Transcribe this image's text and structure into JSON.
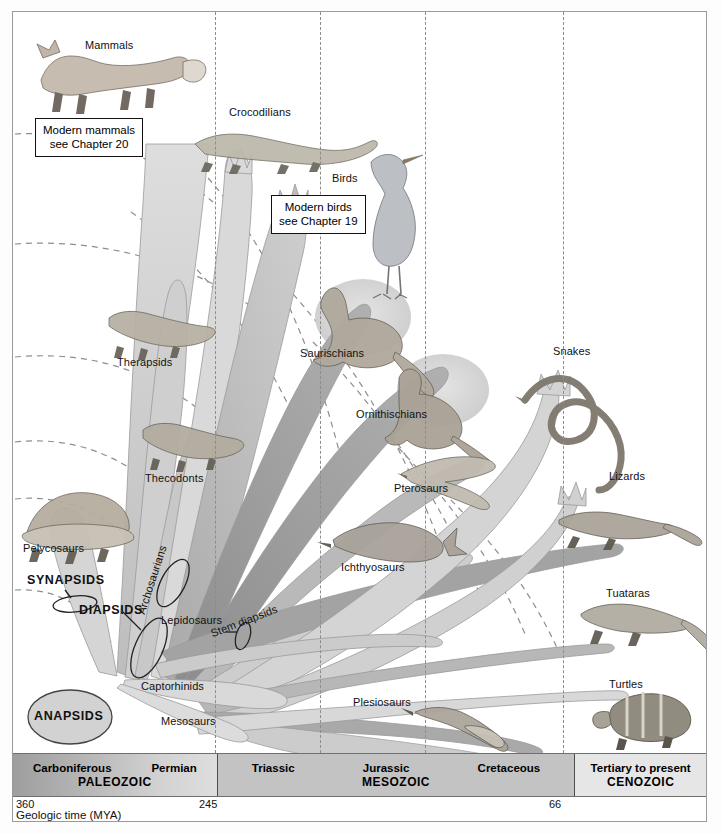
{
  "figure": {
    "caption": "Geologic time (MYA)"
  },
  "callouts": [
    {
      "id": "mammals-callout",
      "line1": "Modern mammals",
      "line2": "see Chapter 20"
    },
    {
      "id": "birds-callout",
      "line1": "Modern birds",
      "line2": "see Chapter 19"
    }
  ],
  "taxa_labels": [
    {
      "name": "Mammals",
      "x": 72,
      "y": 27,
      "style": "plain"
    },
    {
      "name": "Crocodilians",
      "x": 228,
      "y": 94,
      "style": "plain"
    },
    {
      "name": "Birds",
      "x": 331,
      "y": 170,
      "style": "plain"
    },
    {
      "name": "Therapsids",
      "x": 116,
      "y": 354,
      "style": "plain"
    },
    {
      "name": "Saurischians",
      "x": 299,
      "y": 345,
      "style": "plain"
    },
    {
      "name": "Snakes",
      "x": 552,
      "y": 343,
      "style": "plain"
    },
    {
      "name": "Ornithischians",
      "x": 355,
      "y": 406,
      "style": "plain"
    },
    {
      "name": "Thecodonts",
      "x": 144,
      "y": 470,
      "style": "plain"
    },
    {
      "name": "Pterosaurs",
      "x": 393,
      "y": 480,
      "style": "plain"
    },
    {
      "name": "Lizards",
      "x": 608,
      "y": 468,
      "style": "plain"
    },
    {
      "name": "Pelycosaurs",
      "x": 22,
      "y": 540,
      "style": "plain"
    },
    {
      "name": "Ichthyosaurs",
      "x": 340,
      "y": 559,
      "style": "plain"
    },
    {
      "name": "Tuataras",
      "x": 605,
      "y": 585,
      "style": "plain"
    },
    {
      "name": "Plesiosaurs",
      "x": 352,
      "y": 694,
      "style": "plain"
    },
    {
      "name": "Turtles",
      "x": 608,
      "y": 676,
      "style": "plain"
    },
    {
      "name": "Captorhinids",
      "x": 140,
      "y": 678,
      "style": "plain"
    },
    {
      "name": "Mesosaurs",
      "x": 160,
      "y": 713,
      "style": "plain"
    },
    {
      "name": "Lepidosaurs",
      "x": 160,
      "y": 612,
      "style": "plain"
    }
  ],
  "rotated_labels": [
    {
      "name": "Archosaurians",
      "x": 122,
      "y": 600,
      "angle": -72
    },
    {
      "name": "Stem diapsids",
      "x": 196,
      "y": 616,
      "angle": -21
    }
  ],
  "clade_labels": [
    {
      "name": "SYNAPSIDS",
      "x": 26,
      "y": 571,
      "shape": "ellipse-callout"
    },
    {
      "name": "DIAPSIDS",
      "x": 78,
      "y": 601,
      "shape": "ellipse-callout"
    },
    {
      "name": "ANAPSIDS",
      "x": 22,
      "y": 695,
      "shape": "filled-ellipse"
    }
  ],
  "timebar": {
    "eras": [
      {
        "id": "era-paleozoic",
        "name": "PALEOZOIC",
        "periods": [
          "Carboniferous",
          "Permian"
        ],
        "width_pct": 29.4,
        "color": "#b4b4b4"
      },
      {
        "id": "era-mesozoic",
        "name": "MESOZOIC",
        "periods": [
          "Triassic",
          "Jurassic",
          "Cretaceous"
        ],
        "width_pct": 51.6,
        "color": "#c3c3c3"
      },
      {
        "id": "era-cenozoic",
        "name": "CENOZOIC",
        "periods": [
          "Tertiary to present"
        ],
        "width_pct": 19.0,
        "color": "#e6e6e6"
      }
    ]
  },
  "scale": {
    "caption": "Geologic time (MYA)",
    "ticks": [
      {
        "value": "360",
        "x": 2,
        "align": "left"
      },
      {
        "value": "245",
        "x": 200,
        "align": "left"
      },
      {
        "value": "66",
        "x": 548,
        "align": "left"
      }
    ]
  },
  "colors": {
    "branch_light": "#d7d7d7",
    "branch_mid": "#c0c0c0",
    "branch_dark": "#9a9a9a",
    "outline": "#8f8f8f",
    "dashed_guide": "#8c8c8c",
    "frame": "#9a9a9a",
    "text": "#111111"
  }
}
